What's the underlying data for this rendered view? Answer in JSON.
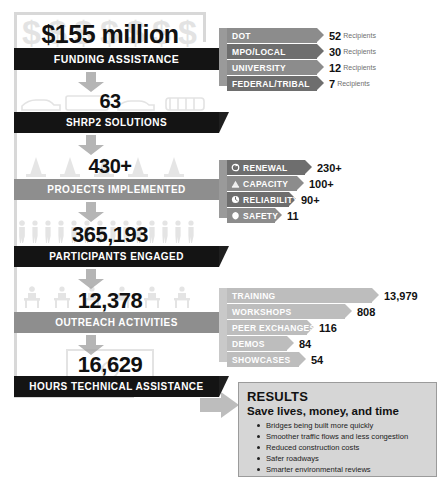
{
  "stages": [
    {
      "value": "$155 million",
      "label": "FUNDING ASSISTANCE",
      "art": "dollars"
    },
    {
      "value": "63",
      "label": "SHRP2 SOLUTIONS",
      "art": "vehicles"
    },
    {
      "value": "430+",
      "label": "PROJECTS IMPLEMENTED",
      "art": "cones"
    },
    {
      "value": "365,193",
      "label": "PARTICIPANTS ENGAGED",
      "art": "people"
    },
    {
      "value": "12,378",
      "label": "OUTREACH ACTIVITIES",
      "art": "meeting"
    },
    {
      "value": "16,629",
      "label": "HOURS TECHNICAL ASSISTANCE",
      "art": "laptop"
    }
  ],
  "funding_recipients": [
    {
      "name": "DOT",
      "count": "52",
      "unit": "Recipients"
    },
    {
      "name": "MPO/LOCAL",
      "count": "30",
      "unit": "Recipients"
    },
    {
      "name": "UNIVERSITY",
      "count": "12",
      "unit": "Recipients"
    },
    {
      "name": "FEDERAL/TRIBAL",
      "count": "7",
      "unit": "Recipients"
    }
  ],
  "solution_areas": [
    {
      "name": "RENEWAL",
      "count": "230+",
      "icon": "renewal-icon"
    },
    {
      "name": "CAPACITY",
      "count": "100+",
      "icon": "capacity-icon"
    },
    {
      "name": "RELIABILITY",
      "count": "90+",
      "icon": "reliability-icon"
    },
    {
      "name": "SAFETY",
      "count": "11",
      "icon": "safety-icon"
    }
  ],
  "outreach_types": [
    {
      "name": "TRAINING",
      "count": "13,979"
    },
    {
      "name": "WORKSHOPS",
      "count": "808"
    },
    {
      "name": "PEER EXCHANGES",
      "count": "116"
    },
    {
      "name": "DEMOS",
      "count": "84"
    },
    {
      "name": "SHOWCASES",
      "count": "54"
    }
  ],
  "results": {
    "title": "RESULTS",
    "subtitle": "Save lives, money, and time",
    "items": [
      "Bridges being built more quickly",
      "Smoother traffic flows and less congestion",
      "Reduced construction costs",
      "Safer roadways",
      "Smarter environmental reviews"
    ]
  },
  "colors": {
    "dark_bar": "#141414",
    "grey_bar": "#8e8e8e",
    "callout_mid": "#8c8c8c",
    "callout_dark": "#6e6e6e",
    "callout_light": "#bdbdbd",
    "results_bg": "#d6d6d6"
  }
}
